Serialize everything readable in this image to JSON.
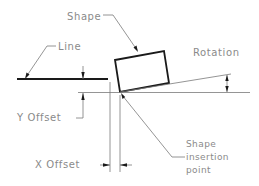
{
  "diagram": {
    "labels": {
      "shape": "Shape",
      "line": "Line",
      "rotation": "Rotation",
      "y_offset": "Y Offset",
      "x_offset": "X Offset",
      "insertion_line1": "Shape",
      "insertion_line2": "insertion",
      "insertion_line3": "point"
    },
    "colors": {
      "text": "#8a8a8a",
      "geometry": "#1a1a1a",
      "dimension": "#7a7a7a",
      "background": "#ffffff"
    }
  }
}
